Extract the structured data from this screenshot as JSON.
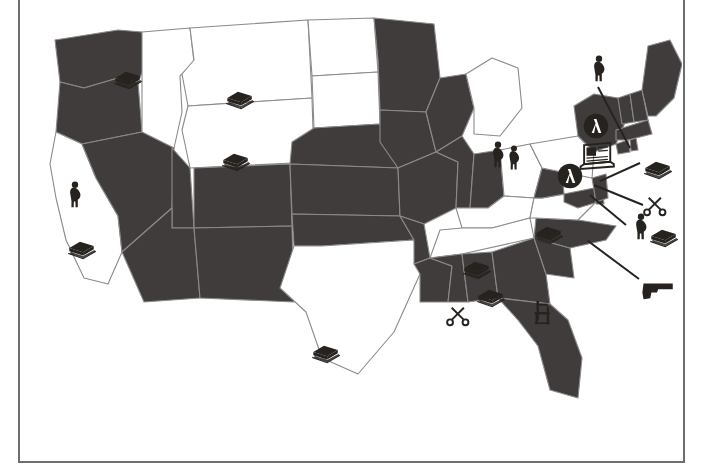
{
  "page": {
    "background_color": "#ffffff",
    "frame_rule_color": "#6e6e6e",
    "width": 706,
    "height": 472
  },
  "map": {
    "projection_note": "contiguous United States, state outlines",
    "fill_dark": "#403c3c",
    "fill_light": "#ffffff",
    "outline_color": "#8a8a8a",
    "legend_shown": false,
    "title_shown": false,
    "labels_shown": false,
    "shaded_states": [
      "Washington",
      "Oregon",
      "Nevada",
      "Utah",
      "Arizona",
      "New Mexico",
      "Colorado",
      "Nebraska",
      "Kansas",
      "Oklahoma",
      "Minnesota",
      "Iowa",
      "Missouri",
      "Arkansas",
      "Louisiana",
      "Wisconsin",
      "Illinois",
      "Indiana",
      "Mississippi",
      "Alabama",
      "Georgia",
      "Florida",
      "South Carolina",
      "North Carolina",
      "West Virginia",
      "Maryland",
      "Delaware",
      "New Jersey",
      "Maine",
      "New Hampshire",
      "Vermont",
      "Massachusetts",
      "Connecticut",
      "Rhode Island",
      "New York"
    ],
    "unshaded_states": [
      "California",
      "Idaho",
      "Montana",
      "Wyoming",
      "North Dakota",
      "South Dakota",
      "Texas",
      "Michigan",
      "Ohio",
      "Kentucky",
      "Tennessee",
      "Virginia",
      "Pennsylvania"
    ]
  },
  "icons": [
    {
      "id": "book-idaho",
      "symbol": "book",
      "name": "book-icon",
      "state": "Idaho",
      "x": 88,
      "y": 58,
      "size": 34,
      "leader": null
    },
    {
      "id": "book-montana",
      "symbol": "book",
      "name": "book-icon",
      "state": "Montana",
      "x": 200,
      "y": 78,
      "size": 34,
      "leader": null
    },
    {
      "id": "book-wyoming",
      "symbol": "book",
      "name": "book-icon",
      "state": "Wyoming",
      "x": 196,
      "y": 140,
      "size": 34,
      "leader": null
    },
    {
      "id": "pregnant-california",
      "symbol": "pregnant-figure",
      "name": "pregnant-figure-icon",
      "state": "California",
      "x": 38,
      "y": 178,
      "size": 30,
      "leader": null
    },
    {
      "id": "book-california",
      "symbol": "book",
      "name": "book-icon",
      "state": "California",
      "x": 42,
      "y": 228,
      "size": 34,
      "leader": null
    },
    {
      "id": "book-texas",
      "symbol": "book",
      "name": "book-icon",
      "state": "Texas",
      "x": 286,
      "y": 332,
      "size": 34,
      "leader": null
    },
    {
      "id": "pregnant-michigan",
      "symbol": "pregnant-figure",
      "name": "pregnant-figure-icon",
      "state": "Michigan",
      "x": 461,
      "y": 138,
      "size": 30,
      "leader": null
    },
    {
      "id": "book-kentucky",
      "symbol": "book",
      "name": "book-icon",
      "state": "Kentucky",
      "x": 451,
      "y": 276,
      "size": 34,
      "leader": null
    },
    {
      "id": "book-tennessee",
      "symbol": "book",
      "name": "book-icon",
      "state": "Tennessee",
      "x": 437,
      "y": 248,
      "size": 34,
      "leader": null
    },
    {
      "id": "book-virginia",
      "symbol": "book",
      "name": "book-icon",
      "state": "Virginia",
      "x": 509,
      "y": 213,
      "size": 34,
      "leader": null
    },
    {
      "id": "scissors-mississippi",
      "symbol": "scissors",
      "name": "scissors-icon",
      "state": "Mississippi",
      "x": 424,
      "y": 300,
      "size": 26,
      "leader": null
    },
    {
      "id": "chair-georgia",
      "symbol": "chair",
      "name": "chair-icon",
      "state": "Georgia",
      "x": 507,
      "y": 296,
      "size": 30,
      "leader": null
    },
    {
      "id": "pregnant-newengland",
      "symbol": "pregnant-figure",
      "name": "pregnant-figure-icon",
      "state": "Vermont",
      "x": 562,
      "y": 52,
      "size": 30,
      "leader": {
        "x1": 576,
        "y1": 84,
        "x2": 608,
        "y2": 145
      }
    },
    {
      "id": "badge-newyork",
      "symbol": "lambda-badge",
      "name": "lambda-badge-icon",
      "state": "New York",
      "x": 560,
      "y": 110,
      "size": 28,
      "leader": null
    },
    {
      "id": "laptop-northeast",
      "symbol": "laptop",
      "name": "laptop-icon",
      "state": "New York",
      "x": 555,
      "y": 136,
      "size": 38,
      "leader": null
    },
    {
      "id": "badge-pennsylvania",
      "symbol": "lambda-badge",
      "name": "lambda-badge-icon",
      "state": "Pennsylvania",
      "x": 534,
      "y": 160,
      "size": 28,
      "leader": null
    },
    {
      "id": "book-northeast",
      "symbol": "book",
      "name": "book-icon",
      "state": "Massachusetts",
      "x": 618,
      "y": 148,
      "size": 34,
      "leader": {
        "x1": 618,
        "y1": 160,
        "x2": 578,
        "y2": 178
      }
    },
    {
      "id": "scissors-northeast",
      "symbol": "scissors",
      "name": "scissors-icon",
      "state": "Delaware",
      "x": 621,
      "y": 190,
      "size": 26,
      "leader": {
        "x1": 621,
        "y1": 202,
        "x2": 572,
        "y2": 182
      }
    },
    {
      "id": "pregnant-northeast",
      "symbol": "pregnant-figure",
      "name": "pregnant-figure-icon",
      "state": "Maryland",
      "x": 604,
      "y": 210,
      "size": 30,
      "leader": {
        "x1": 604,
        "y1": 222,
        "x2": 568,
        "y2": 192
      }
    },
    {
      "id": "book-mid-atlantic",
      "symbol": "book",
      "name": "book-icon",
      "state": "New Jersey",
      "x": 624,
      "y": 216,
      "size": 34,
      "leader": null
    },
    {
      "id": "gun-southeast",
      "symbol": "handgun",
      "name": "handgun-icon",
      "state": "North Carolina",
      "x": 617,
      "y": 268,
      "size": 36,
      "leader": {
        "x1": 617,
        "y1": 276,
        "x2": 566,
        "y2": 238
      }
    },
    {
      "id": "pregnant-ohio",
      "symbol": "pregnant-figure",
      "name": "pregnant-figure-icon",
      "state": "Ohio",
      "x": 478,
      "y": 142,
      "size": 28,
      "leader": null
    }
  ],
  "symbol_legend": {
    "book": "book",
    "pregnant-figure": "pregnant figure",
    "scissors": "scissors",
    "chair": "chair",
    "lambda-badge": "lambda badge",
    "laptop": "laptop",
    "handgun": "handgun"
  }
}
